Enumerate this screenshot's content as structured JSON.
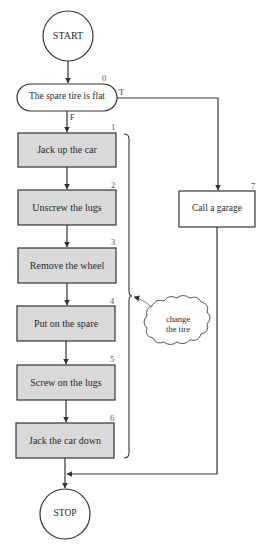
{
  "colors": {
    "line": "#333333",
    "step_fill": "#d9d9d9",
    "background": "#ffffff"
  },
  "terminals": {
    "start": {
      "label": "START"
    },
    "stop": {
      "label": "STOP"
    }
  },
  "decision": {
    "number": "0",
    "label": "The spare tire is flat",
    "true_label": "T",
    "false_label": "F"
  },
  "steps": [
    {
      "number": "1",
      "label": "Jack up the car"
    },
    {
      "number": "2",
      "label": "Unscrew the lugs"
    },
    {
      "number": "3",
      "label": "Remove the wheel"
    },
    {
      "number": "4",
      "label": "Put on the spare"
    },
    {
      "number": "5",
      "label": "Screw on the lugs"
    },
    {
      "number": "6",
      "label": "Jack the car down"
    }
  ],
  "alternate": {
    "number": "7",
    "label": "Call a garage"
  },
  "annotation": {
    "line1": "change",
    "line2": "the tire"
  }
}
